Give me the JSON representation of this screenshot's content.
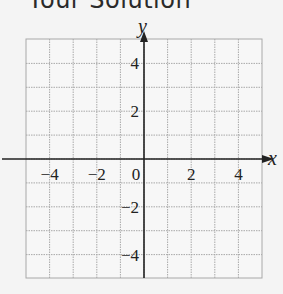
{
  "header": {
    "title": "Your Solution"
  },
  "chart_data": {
    "type": "scatter",
    "title": "",
    "xlabel": "x",
    "ylabel": "y",
    "xlim": [
      -5,
      5
    ],
    "ylim": [
      -5,
      5
    ],
    "grid": true,
    "grid_step": 1,
    "x_ticks": [
      -4,
      -2,
      0,
      2,
      4
    ],
    "y_ticks": [
      4,
      2,
      -2,
      -4
    ],
    "x_tick_labels": [
      "−4",
      "−2",
      "0",
      "2",
      "4"
    ],
    "y_tick_labels": [
      "4",
      "2",
      "−2",
      "−4"
    ],
    "series": []
  },
  "colors": {
    "grid": "#a8a8a8",
    "axis": "#222222",
    "background": "#f4f4f4"
  }
}
